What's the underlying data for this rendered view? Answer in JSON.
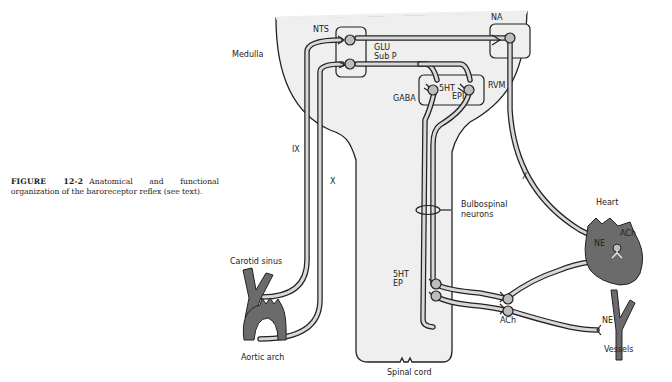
{
  "caption": {
    "figure_label": "FIGURE 12-2",
    "text": "Anatomical and functional organization of the baroreceptor reflex (see text)."
  },
  "labels": {
    "medulla": "Medulla",
    "nts": "NTS",
    "na": "NA",
    "glu": "GLU",
    "subp": "Sub P",
    "gaba": "GABA",
    "fivehta": "5HT",
    "epi": "EPI",
    "rvm": "RVM",
    "ix": "IX",
    "x1": "X",
    "x2": "X",
    "carotid": "Carotid sinus",
    "aortic": "Aortic arch",
    "bulbo1": "Bulbospinal",
    "bulbo2": "neurons",
    "fivehtb": "5HT",
    "ep": "EP",
    "spinal": "Spinal cord",
    "ach1": "ACh",
    "ach2": "ACh",
    "ne1": "NE",
    "ne2": "NE",
    "heart": "Heart",
    "vessels": "Vessels"
  },
  "colors": {
    "tissue_fill": "#efefef",
    "organ_fill": "#6b6b6b",
    "fiber_fill": "#d8d8d8",
    "outline": "#222222",
    "soma_fill": "#bdbdbd"
  }
}
